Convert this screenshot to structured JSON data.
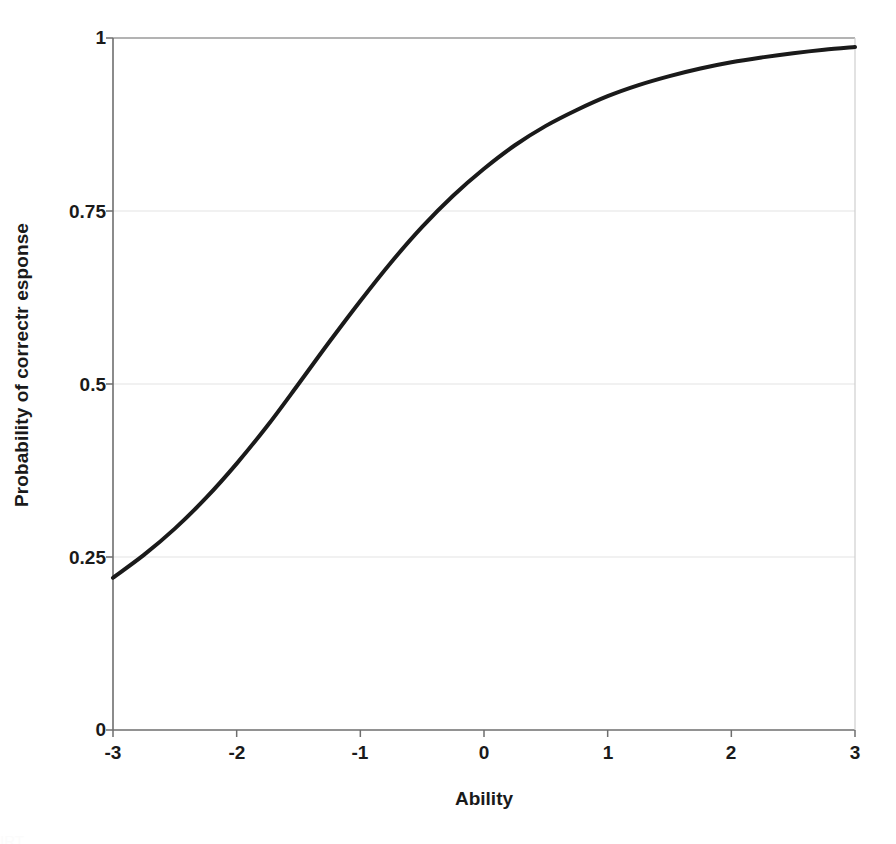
{
  "chart_data": {
    "type": "line",
    "title": "",
    "subtitle": "",
    "xlabel": "Ability",
    "ylabel": "Probability of correctr esponse",
    "xlim": [
      -3,
      3
    ],
    "ylim": [
      0,
      1
    ],
    "xticks": [
      "-3",
      "-2",
      "-1",
      "0",
      "1",
      "2",
      "3"
    ],
    "xtick_values": [
      -3,
      -2,
      -1,
      0,
      1,
      2,
      3
    ],
    "yticks": [
      "0",
      "0.25",
      "0.5",
      "0.75",
      "1"
    ],
    "ytick_values": [
      0,
      0.25,
      0.5,
      0.75,
      1
    ],
    "grid": "horizontal",
    "legend": "none",
    "annotations": [],
    "series": [
      {
        "name": "Item characteristic curve",
        "color": "#1a1a1a",
        "line_width": 4,
        "x": [
          -3,
          -2.75,
          -2.5,
          -2.25,
          -2,
          -1.75,
          -1.5,
          -1.25,
          -1,
          -0.75,
          -0.5,
          -0.25,
          0,
          0.25,
          0.5,
          0.75,
          1,
          1.25,
          1.5,
          1.75,
          2,
          2.25,
          2.5,
          2.75,
          3
        ],
        "values": [
          0.22,
          0.253,
          0.291,
          0.335,
          0.385,
          0.44,
          0.5,
          0.561,
          0.62,
          0.676,
          0.727,
          0.772,
          0.811,
          0.845,
          0.873,
          0.896,
          0.916,
          0.932,
          0.945,
          0.956,
          0.965,
          0.972,
          0.978,
          0.983,
          0.987
        ]
      }
    ]
  },
  "axis": {
    "x_title": "Ability",
    "y_title": "Probability of correctr esponse",
    "x_tick_labels": [
      "-3",
      "-2",
      "-1",
      "0",
      "1",
      "2",
      "3"
    ],
    "y_tick_labels": [
      "0",
      "0.25",
      "0.5",
      "0.75",
      "1"
    ]
  },
  "style": {
    "curve_color": "#1a1a1a",
    "grid_color": "#e3e3e3",
    "axis_color": "#6e6e6e",
    "background": "#ffffff",
    "text_color": "#1a1a1a"
  },
  "caption": {
    "cut_off_text": "IRT"
  }
}
